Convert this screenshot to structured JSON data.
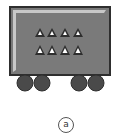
{
  "figure": {
    "label": "a",
    "wagon": {
      "body_color": "#7a7a7a",
      "border_color": "#2e2e2e",
      "highlight_color": "#c8c8c8",
      "wheel_color": "#4a4a4a",
      "wheel_count": 4,
      "triangle_rows": 2,
      "triangles_per_row": 4,
      "triangle_color": "#2e2e2e",
      "triangle_inner_color": "#ffffff"
    }
  }
}
